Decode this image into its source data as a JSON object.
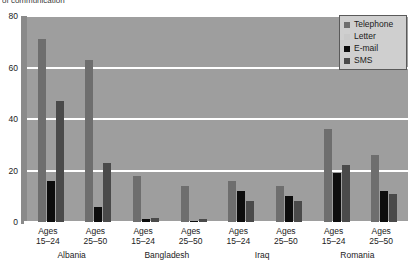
{
  "chart_title": "of communication",
  "legend": {
    "position": "top-right",
    "entries": [
      {
        "label": "Telephone",
        "color": "#6e6e6e"
      },
      {
        "label": "Letter",
        "color": "#c9c9c9"
      },
      {
        "label": "E-mail",
        "color": "#0d0d0d"
      },
      {
        "label": "SMS",
        "color": "#4a4a4a"
      }
    ]
  },
  "axis": {
    "y_ticks": [
      "0",
      "20",
      "40",
      "60",
      "80"
    ],
    "y_min": 0,
    "y_max": 80
  },
  "groups": [
    {
      "country": "Albania",
      "age_line1": "Ages",
      "age_line2": "15–24"
    },
    {
      "country": "Albania",
      "age_line1": "Ages",
      "age_line2": "25–50"
    },
    {
      "country": "Bangladesh",
      "age_line1": "Ages",
      "age_line2": "15–24"
    },
    {
      "country": "Bangladesh",
      "age_line1": "Ages",
      "age_line2": "25–50"
    },
    {
      "country": "Iraq",
      "age_line1": "Ages",
      "age_line2": "15–24"
    },
    {
      "country": "Iraq",
      "age_line1": "Ages",
      "age_line2": "25–50"
    },
    {
      "country": "Romania",
      "age_line1": "Ages",
      "age_line2": "15–24"
    },
    {
      "country": "Romania",
      "age_line1": "Ages",
      "age_line2": "25–50"
    }
  ],
  "countries": [
    "Albania",
    "Bangladesh",
    "Iraq",
    "Romania"
  ],
  "chart_data": {
    "type": "bar",
    "title": "of communication",
    "xlabel": "",
    "ylabel": "",
    "ylim": [
      0,
      80
    ],
    "yticks": [
      0,
      20,
      40,
      60,
      80
    ],
    "grid": true,
    "legend_position": "top-right",
    "categories": [
      "Albania Ages 15–24",
      "Albania Ages 25–50",
      "Bangladesh Ages 15–24",
      "Bangladesh Ages 25–50",
      "Iraq Ages 15–24",
      "Iraq Ages 25–50",
      "Romania Ages 15–24",
      "Romania Ages 25–50"
    ],
    "series": [
      {
        "name": "Telephone",
        "color": "#6e6e6e",
        "values": [
          71,
          63,
          18,
          14,
          16,
          14,
          36,
          26
        ]
      },
      {
        "name": "Letter",
        "color": "#c9c9c9",
        "values": [
          0,
          0,
          0,
          0,
          0,
          0,
          0,
          0
        ]
      },
      {
        "name": "E-mail",
        "color": "#0d0d0d",
        "values": [
          16,
          6,
          1,
          0.5,
          12,
          10,
          19,
          12
        ]
      },
      {
        "name": "SMS",
        "color": "#4a4a4a",
        "values": [
          47,
          23,
          1.5,
          1,
          8,
          8,
          22,
          11
        ]
      }
    ]
  }
}
